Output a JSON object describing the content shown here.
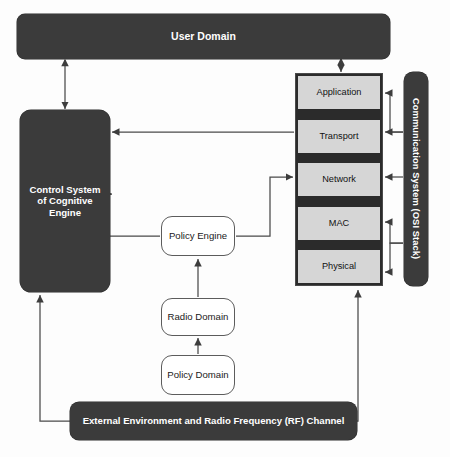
{
  "diagram": {
    "background_color": "#fdfdfd",
    "dark_fill": "#3b3b3b",
    "layer_fill": "#d6d6d6",
    "stack_frame_fill": "#2b2b2b",
    "line_color": "#4a4a4a"
  },
  "nodes": {
    "user_domain": {
      "label": "User Domain"
    },
    "control_system": {
      "label": "Control System of Cognitive Engine"
    },
    "policy_engine": {
      "label": "Policy Engine"
    },
    "radio_domain": {
      "label": "Radio Domain"
    },
    "policy_domain": {
      "label": "Policy Domain"
    },
    "rf_channel": {
      "label": "External Environment and Radio Frequency (RF) Channel"
    },
    "comm_system": {
      "label": "Communication System (OSI Stack)"
    }
  },
  "osi_stack": {
    "layers": [
      {
        "label": "Application"
      },
      {
        "label": "Transport"
      },
      {
        "label": "Network"
      },
      {
        "label": "MAC"
      },
      {
        "label": "Physical"
      }
    ]
  },
  "caption": {
    "text": ""
  }
}
